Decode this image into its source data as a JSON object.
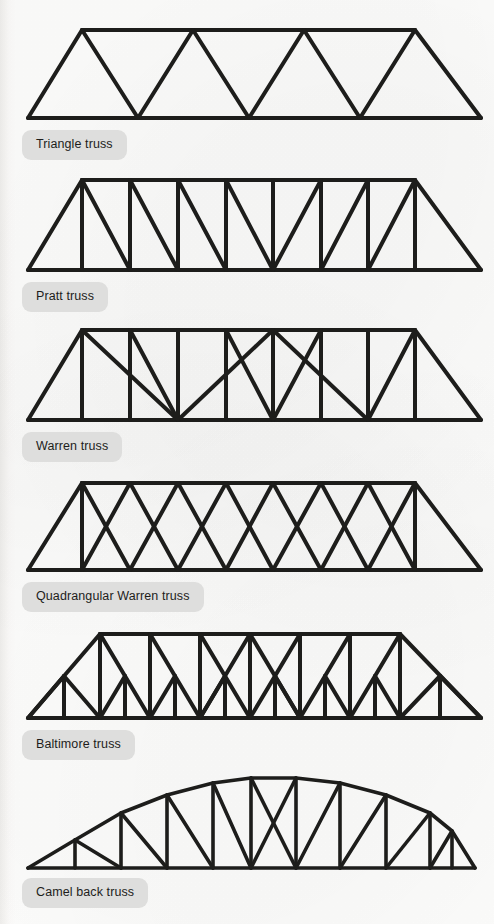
{
  "page": {
    "background_color": "#fdfdfc",
    "ink_color": "#1d1d1b",
    "caption_background": "#dededd",
    "caption_text_color": "#1d1d1b"
  },
  "figures": [
    {
      "id": "triangle-truss",
      "label": "Triangle truss",
      "description": "Bottom chord with four large triangles formed by a continuous zigzag of diagonals and a shorter top chord.",
      "panels": 4,
      "has_verticals": false,
      "top_chord_shape": "straight",
      "geometry": {
        "bottom_chord": [
          28,
          118,
          481,
          118
        ],
        "top_chord": [
          82,
          30,
          415,
          30
        ],
        "top_nodes_x": [
          82,
          193,
          304,
          415
        ],
        "bottom_nodes_x": [
          28,
          138,
          249,
          360,
          481
        ],
        "diagonals": [
          [
            28,
            118,
            82,
            30
          ],
          [
            82,
            30,
            138,
            118
          ],
          [
            138,
            118,
            193,
            30
          ],
          [
            193,
            30,
            249,
            118
          ],
          [
            249,
            118,
            304,
            30
          ],
          [
            304,
            30,
            360,
            118
          ],
          [
            360,
            118,
            415,
            30
          ],
          [
            415,
            30,
            481,
            118
          ]
        ]
      },
      "caption_pos": [
        22,
        130
      ]
    },
    {
      "id": "pratt-truss",
      "label": "Pratt truss",
      "description": "Rectangular panels with vertical members and diagonals sloping down toward the centre of the span.",
      "panels": 8,
      "has_verticals": true,
      "top_chord_shape": "straight",
      "geometry": {
        "bottom_chord": [
          28,
          270,
          481,
          270
        ],
        "top_chord": [
          82,
          180,
          415,
          180
        ],
        "top_nodes_x": [
          82,
          130,
          178,
          226,
          273,
          321,
          368,
          415
        ],
        "bottom_nodes_x": [
          28,
          82,
          130,
          178,
          226,
          273,
          321,
          368,
          415,
          481
        ]
      },
      "caption_pos": [
        22,
        282
      ]
    },
    {
      "id": "warren-truss",
      "label": "Warren truss",
      "description": "Equilateral zigzag diagonals with additional vertical members at the top nodes.",
      "panels": 8,
      "has_verticals": true,
      "top_chord_shape": "straight",
      "geometry": {
        "bottom_chord": [
          28,
          420,
          481,
          420
        ],
        "top_chord": [
          82,
          330,
          415,
          330
        ],
        "top_nodes_x": [
          82,
          130,
          178,
          226,
          273,
          321,
          368,
          415
        ],
        "bottom_nodes_x": [
          28,
          82,
          130,
          178,
          226,
          273,
          321,
          368,
          415,
          481
        ]
      },
      "caption_pos": [
        22,
        432
      ]
    },
    {
      "id": "quadrangular-warren-truss",
      "label": "Quadrangular Warren truss",
      "description": "Crossed diagonals forming X shapes in every panel, with verticals only at the two end posts.",
      "panels": 7,
      "has_verticals": true,
      "top_chord_shape": "straight",
      "geometry": {
        "bottom_chord": [
          28,
          570,
          481,
          570
        ],
        "top_chord": [
          82,
          483,
          415,
          483
        ],
        "top_nodes_x": [
          82,
          130,
          178,
          226,
          273,
          321,
          368,
          415
        ],
        "bottom_nodes_x": [
          28,
          82,
          130,
          178,
          226,
          273,
          321,
          368,
          415,
          481
        ]
      },
      "caption_pos": [
        22,
        582
      ]
    },
    {
      "id": "baltimore-truss",
      "label": "Baltimore truss",
      "description": "Pratt-type truss with sub-divided panels: half-length sub-verticals and sub-diagonals brace each main panel.",
      "panels": 8,
      "has_verticals": true,
      "has_subdivisions": true,
      "top_chord_shape": "straight",
      "geometry": {
        "bottom_chord": [
          28,
          718,
          481,
          718
        ],
        "top_chord": [
          100,
          634,
          400,
          634
        ],
        "top_nodes_x": [
          100,
          150,
          200,
          250,
          300,
          350,
          400
        ],
        "bottom_nodes_x": [
          28,
          64,
          100,
          137,
          175,
          212,
          250,
          287,
          325,
          362,
          400,
          440,
          481
        ]
      },
      "caption_pos": [
        22,
        730
      ]
    },
    {
      "id": "camel-back-truss",
      "label": "Camel back truss",
      "description": "Polygonal arched top chord rising to the centre, with verticals and diagonals plus a crossed X pair at midspan.",
      "panels": 10,
      "has_verticals": true,
      "top_chord_shape": "arched-polygonal",
      "geometry": {
        "bottom_chord": [
          28,
          868,
          475,
          868
        ],
        "top_chord_nodes": [
          [
            75,
            855
          ],
          [
            121,
            827
          ],
          [
            167,
            805
          ],
          [
            213,
            789
          ],
          [
            251,
            781
          ],
          [
            296,
            780
          ],
          [
            340,
            789
          ],
          [
            386,
            805
          ],
          [
            430,
            827
          ],
          [
            475,
            855
          ]
        ]
      },
      "caption_pos": [
        22,
        878
      ]
    }
  ]
}
